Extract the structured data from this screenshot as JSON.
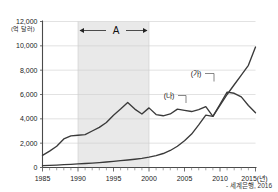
{
  "chart_data": {
    "type": "line",
    "title": "",
    "subtitle": "",
    "xlabel": "2015(년)",
    "ylabel": "",
    "unit_label": "(억 달러)",
    "xlim": [
      1985,
      2015
    ],
    "ylim": [
      0,
      12000
    ],
    "grid": true,
    "legend_position": "inline-annotation",
    "x_tick_labels": [
      "1985",
      "1990",
      "1995",
      "2000",
      "2005",
      "2010",
      "2015(년)"
    ],
    "x_tick_values": [
      1985,
      1990,
      1995,
      2000,
      2005,
      2010,
      2015
    ],
    "y_tick_labels": [
      "0",
      "2,000",
      "4,000",
      "6,000",
      "8,000",
      "10,000",
      "12,000"
    ],
    "y_tick_values": [
      0,
      2000,
      4000,
      6000,
      8000,
      10000,
      12000
    ],
    "x": [
      1985,
      1986,
      1987,
      1988,
      1989,
      1990,
      1991,
      1992,
      1993,
      1994,
      1995,
      1996,
      1997,
      1998,
      1999,
      2000,
      2001,
      2002,
      2003,
      2004,
      2005,
      2006,
      2007,
      2008,
      2009,
      2010,
      2011,
      2012,
      2013,
      2014,
      2015
    ],
    "series": [
      {
        "name": "(가)",
        "label": "(가)",
        "values": [
          150,
          180,
          200,
          230,
          260,
          300,
          330,
          360,
          400,
          450,
          500,
          560,
          620,
          680,
          750,
          850,
          980,
          1150,
          1400,
          1750,
          2200,
          2750,
          3500,
          4300,
          4200,
          5100,
          6000,
          6800,
          7600,
          8400,
          9900
        ]
      },
      {
        "name": "(나)",
        "label": "(나)",
        "values": [
          1000,
          1350,
          1750,
          2350,
          2600,
          2650,
          2700,
          3000,
          3300,
          3700,
          4300,
          4800,
          5350,
          4800,
          4400,
          4900,
          4350,
          4250,
          4400,
          4800,
          4700,
          4600,
          4750,
          5000,
          4200,
          5200,
          6200,
          6100,
          5800,
          5100,
          4500
        ]
      }
    ],
    "annotations": [
      {
        "name": "band-A",
        "label": "A",
        "x_start": 1990,
        "x_end": 2000,
        "type": "shaded-span-with-arrow"
      }
    ],
    "source": "- 세계은행, 2016"
  }
}
